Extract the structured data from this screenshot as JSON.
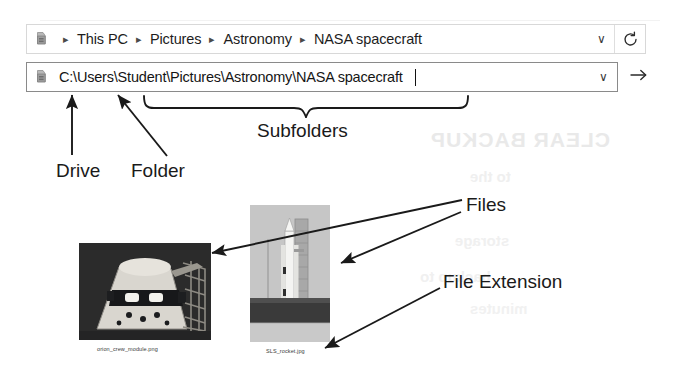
{
  "window": {
    "breadcrumb": {
      "icon": "drive-icon",
      "items": [
        "This PC",
        "Pictures",
        "Astronomy",
        "NASA spacecraft"
      ],
      "separator": "▸",
      "dropdown_caret": "∨",
      "refresh_icon": "refresh-icon"
    },
    "path_bar": {
      "icon": "drive-icon",
      "value": "C:\\Users\\Student\\Pictures\\Astronomy\\NASA spacecraft",
      "placeholder": "Enter a file path",
      "dropdown_caret": "∨",
      "go_icon": "arrow-right-icon"
    }
  },
  "annotations": {
    "drive": "Drive",
    "folder": "Folder",
    "subfolders": "Subfolders",
    "files": "Files",
    "file_extension": "File Extension"
  },
  "files": [
    {
      "name": "orion_crew_module.png",
      "thumbnail": "orion-crew-module-photo"
    },
    {
      "name": "SLS_rocket.jpg",
      "thumbnail": "sls-rocket-photo"
    }
  ],
  "bleed_through": {
    "line1": "CLEAR BACKUP",
    "line2": "to the",
    "line3": "storage",
    "line4": "backup to",
    "line5": "minutes"
  },
  "colors": {
    "page_background": "#ffffff",
    "ink": "#1a1a1a",
    "field_border": "#8a8a8a",
    "crumb_border": "#d8d8d8",
    "bleed": "#ececec"
  }
}
